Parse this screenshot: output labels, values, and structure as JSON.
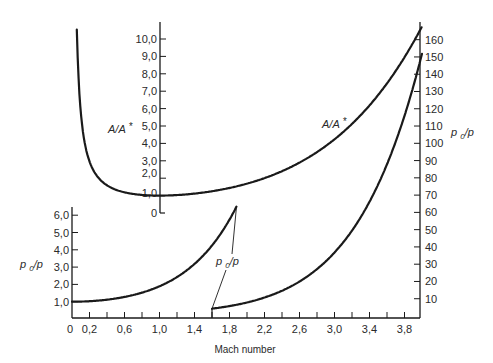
{
  "chart_data": {
    "type": "line",
    "title": "",
    "xlabel": "Mach number",
    "x_ticks": [
      "0",
      "0.2",
      "0.6",
      "1.0",
      "1.4",
      "1.8",
      "2.2",
      "2.6",
      "3.0",
      "3.4",
      "3.8"
    ],
    "x_tick_values": [
      0,
      0.2,
      0.6,
      1.0,
      1.4,
      1.8,
      2.2,
      2.6,
      3.0,
      3.4,
      3.8
    ],
    "x_minor_ticks": [
      0.2,
      0.4,
      0.6,
      0.8,
      1.0,
      1.2,
      1.4,
      1.6,
      1.8,
      2.0,
      2.2,
      2.4,
      2.6,
      2.8,
      3.0,
      3.2,
      3.4,
      3.6,
      3.8
    ],
    "xlim": [
      0,
      4.0
    ],
    "grid": false,
    "axes": {
      "area_ratio": {
        "label": "A/A*",
        "position": "inner-left at Mach ~1.0",
        "ticks": [
          "0",
          "1.0",
          "2.0",
          "3.0",
          "4.0",
          "5.0",
          "6.0",
          "7.0",
          "8.0",
          "9.0",
          "10.0"
        ],
        "tick_values": [
          0,
          1,
          2,
          3,
          4,
          5,
          6,
          7,
          8,
          9,
          10
        ],
        "ylim": [
          0,
          11
        ]
      },
      "pressure_ratio_low": {
        "label": "p0/p",
        "position": "left",
        "ticks": [
          "1.0",
          "2.0",
          "3.0",
          "4.0",
          "5.0",
          "6.0"
        ],
        "tick_values": [
          1,
          2,
          3,
          4,
          5,
          6
        ],
        "ylim": [
          0,
          6.5
        ]
      },
      "pressure_ratio_high": {
        "label": "p0/p",
        "position": "right",
        "ticks": [
          "10",
          "20",
          "30",
          "40",
          "50",
          "60",
          "70",
          "80",
          "90",
          "100",
          "110",
          "120",
          "130",
          "140",
          "150",
          "160"
        ],
        "tick_values": [
          10,
          20,
          30,
          40,
          50,
          60,
          70,
          80,
          90,
          100,
          110,
          120,
          130,
          140,
          150,
          160
        ],
        "ylim": [
          0,
          170
        ]
      }
    },
    "series": [
      {
        "name": "A/A*",
        "axis": "area_ratio",
        "x": [
          0.055,
          0.08,
          0.1,
          0.15,
          0.2,
          0.3,
          0.4,
          0.5,
          0.6,
          0.8,
          1.0,
          1.2,
          1.5,
          2.0,
          2.5,
          3.0,
          3.5,
          4.0
        ],
        "values": [
          10.5,
          7.26,
          5.82,
          3.91,
          2.96,
          2.04,
          1.59,
          1.34,
          1.19,
          1.04,
          1.0,
          1.03,
          1.18,
          1.69,
          2.64,
          4.23,
          6.79,
          10.72
        ]
      },
      {
        "name": "p0/p (subsonic-low scale)",
        "axis": "pressure_ratio_low",
        "x": [
          0,
          0.2,
          0.4,
          0.6,
          0.8,
          1.0,
          1.2,
          1.4,
          1.6,
          1.8,
          1.88
        ],
        "values": [
          1.0,
          1.03,
          1.12,
          1.28,
          1.52,
          1.89,
          2.42,
          3.18,
          4.25,
          5.75,
          6.5
        ]
      },
      {
        "name": "p0/p (high scale)",
        "axis": "pressure_ratio_high",
        "x": [
          1.6,
          1.8,
          2.0,
          2.2,
          2.4,
          2.6,
          2.8,
          3.0,
          3.2,
          3.4,
          3.6,
          3.8,
          4.0
        ],
        "values": [
          4.25,
          5.75,
          7.82,
          10.69,
          14.62,
          19.95,
          27.14,
          36.73,
          49.43,
          66.1,
          87.83,
          115.9,
          151.8
        ]
      }
    ],
    "annotations": [
      {
        "text": "A/A*",
        "near": "area ratio axis"
      },
      {
        "text": "A/A*",
        "near": "supersonic A/A* curve"
      },
      {
        "text": "p0/p",
        "near": "low-scale p0/p axis"
      },
      {
        "text": "p0/p",
        "near": "leader lines to both p0/p curves at Mach 1.6–1.9"
      },
      {
        "text": "p0/p",
        "near": "right high-scale axis"
      }
    ],
    "legend": "none",
    "line_color": "#1a1a1a"
  },
  "labels": {
    "xlabel": "Mach number",
    "area_axis_label": "A/A*",
    "area_curve_label": "A/A*",
    "p_low_axis_label": "p0/p",
    "p_leader_label": "p0/p",
    "p_high_axis_label": "p0/p"
  }
}
